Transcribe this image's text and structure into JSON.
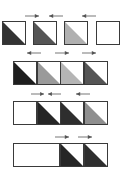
{
  "diagram": {
    "colors": {
      "border": "#3a3a3a",
      "darkest": "#1e1e1e",
      "dark": "#333333",
      "medium_dark": "#555555",
      "medium": "#8f8f8f",
      "light": "#b5b5b5",
      "arrow": "#555555"
    },
    "rows": [
      {
        "cells": [
          {
            "x": 2,
            "y": 21,
            "w": 24,
            "h": 24,
            "fill": "#333333"
          },
          {
            "x": 33,
            "y": 21,
            "w": 24,
            "h": 24,
            "fill": "#555555"
          },
          {
            "x": 64,
            "y": 21,
            "w": 24,
            "h": 24,
            "fill": "#b0b0b0"
          },
          {
            "x": 96,
            "y": 21,
            "w": 24,
            "h": 24,
            "fill": null
          }
        ],
        "arrows": [
          {
            "x": 25,
            "y": 14,
            "w": 14,
            "dir": "right"
          },
          {
            "x": 49,
            "y": 14,
            "w": 14,
            "dir": "left"
          },
          {
            "x": 82,
            "y": 14,
            "w": 14,
            "dir": "left"
          }
        ]
      },
      {
        "cells": [
          {
            "x": 13,
            "y": 61,
            "w": 24,
            "h": 24,
            "fill": "#1e1e1e"
          },
          {
            "x": 37,
            "y": 61,
            "w": 24,
            "h": 24,
            "fill": "#9a9a9a"
          },
          {
            "x": 60,
            "y": 61,
            "w": 24,
            "h": 24,
            "fill": "#b5b5b5"
          },
          {
            "x": 84,
            "y": 61,
            "w": 24,
            "h": 24,
            "fill": "#555555"
          }
        ],
        "arrows": [
          {
            "x": 27,
            "y": 51,
            "w": 14,
            "dir": "left"
          },
          {
            "x": 55,
            "y": 51,
            "w": 14,
            "dir": "right"
          },
          {
            "x": 82,
            "y": 51,
            "w": 14,
            "dir": "right"
          }
        ]
      },
      {
        "cells": [
          {
            "x": 13,
            "y": 101,
            "w": 24,
            "h": 24,
            "fill": null
          },
          {
            "x": 37,
            "y": 101,
            "w": 24,
            "h": 24,
            "fill": "#262626"
          },
          {
            "x": 60,
            "y": 101,
            "w": 24,
            "h": 24,
            "fill": "#2e2e2e"
          },
          {
            "x": 84,
            "y": 101,
            "w": 24,
            "h": 24,
            "fill": "#8f8f8f"
          }
        ],
        "arrows": [
          {
            "x": 31,
            "y": 92,
            "w": 13,
            "dir": "right"
          },
          {
            "x": 48,
            "y": 92,
            "w": 13,
            "dir": "left"
          },
          {
            "x": 76,
            "y": 92,
            "w": 14,
            "dir": "left"
          }
        ]
      },
      {
        "cells": [
          {
            "x": 13,
            "y": 143,
            "w": 47,
            "h": 24,
            "fill": null
          },
          {
            "x": 60,
            "y": 143,
            "w": 24,
            "h": 24,
            "fill": "#262626"
          },
          {
            "x": 84,
            "y": 143,
            "w": 24,
            "h": 24,
            "fill": "#2e2e2e"
          }
        ],
        "arrows": [
          {
            "x": 55,
            "y": 135,
            "w": 14,
            "dir": "right"
          },
          {
            "x": 78,
            "y": 135,
            "w": 14,
            "dir": "right"
          }
        ]
      }
    ]
  }
}
